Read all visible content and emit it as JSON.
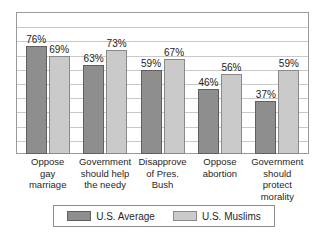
{
  "chart_data": {
    "type": "bar",
    "title": "",
    "subtitle": "",
    "xlabel": "",
    "ylabel": "",
    "ylim": [
      0,
      100
    ],
    "grid": true,
    "gridline_values": [
      10,
      20,
      30,
      40,
      50,
      60,
      70,
      80,
      90
    ],
    "legend_position": "bottom",
    "value_suffix": "%",
    "categories": [
      "Oppose gay marriage",
      "Government should help the needy",
      "Disapprove of Pres. Bush",
      "Oppose abortion",
      "Government should protect morality"
    ],
    "category_lines": [
      [
        "Oppose",
        "gay",
        "marriage"
      ],
      [
        "Government",
        "should help",
        "the needy"
      ],
      [
        "Disapprove",
        "of Pres.",
        "Bush"
      ],
      [
        "Oppose",
        "abortion"
      ],
      [
        "Government",
        "should protect",
        "morality"
      ]
    ],
    "series": [
      {
        "name": "U.S. Average",
        "color": "#8e8e8e",
        "values": [
          76,
          63,
          59,
          46,
          37
        ],
        "labels": [
          "76%",
          "63%",
          "59%",
          "46%",
          "37%"
        ]
      },
      {
        "name": "U.S. Muslims",
        "color": "#cacaca",
        "values": [
          69,
          73,
          67,
          56,
          59
        ],
        "labels": [
          "69%",
          "73%",
          "67%",
          "56%",
          "59%"
        ]
      }
    ]
  },
  "legend": {
    "items": [
      {
        "label": "U.S. Average",
        "color": "#8e8e8e"
      },
      {
        "label": "U.S. Muslims",
        "color": "#cacaca"
      }
    ]
  }
}
